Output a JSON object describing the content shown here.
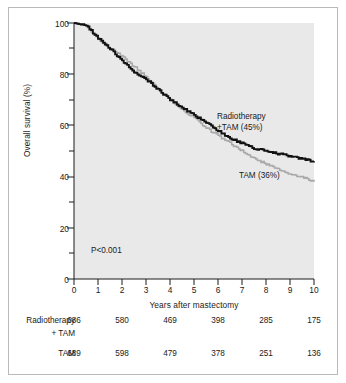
{
  "chart_data": {
    "type": "line",
    "title": "",
    "xlabel": "Years after mastectomy",
    "ylabel": "Overall survival (%)",
    "xlim": [
      0,
      10
    ],
    "ylim": [
      0,
      100
    ],
    "grid": false,
    "x_ticks": [
      "0",
      "1",
      "2",
      "3",
      "4",
      "5",
      "6",
      "7",
      "8",
      "9",
      "10"
    ],
    "y_ticks": [
      "0",
      "20",
      "40",
      "60",
      "80",
      "100"
    ],
    "y_minor_ticks": [
      10,
      30,
      50,
      70,
      90
    ],
    "annotation": "P<0.001",
    "legend_position": "inline-right",
    "series": [
      {
        "name": "Radiotherapy +TAM",
        "label": "Radiotherapy\n+TAM (45%)",
        "label_line1": "Radiotherapy",
        "label_line2": "+TAM (45%)",
        "color": "#111111",
        "final_value": 45,
        "x": [
          0,
          0.5,
          1,
          1.5,
          2,
          2.5,
          3,
          3.5,
          4,
          4.5,
          5,
          5.5,
          6,
          6.5,
          7,
          7.5,
          8,
          8.5,
          9,
          9.5,
          10
        ],
        "values": [
          100,
          99,
          94,
          90,
          85,
          81,
          78,
          74,
          70,
          67,
          64,
          61,
          58,
          55,
          53,
          51,
          50,
          49,
          48,
          47,
          46
        ]
      },
      {
        "name": "TAM",
        "label": "TAM (36%)",
        "label_line1": "TAM (36%)",
        "color": "#a8a8a8",
        "final_value": 36,
        "x": [
          0,
          0.5,
          1,
          1.5,
          2,
          2.5,
          3,
          3.5,
          4,
          4.5,
          5,
          5.5,
          6,
          6.5,
          7,
          7.5,
          8,
          8.5,
          9,
          9.5,
          10
        ],
        "values": [
          100,
          99,
          94,
          90,
          87,
          83,
          79,
          74,
          70,
          66,
          63,
          59,
          56,
          53,
          50,
          47,
          45,
          43,
          41,
          40,
          38
        ]
      }
    ]
  },
  "risk_table": {
    "columns": [
      "0",
      "2",
      "4",
      "6",
      "8",
      "10"
    ],
    "rows": [
      {
        "name": "Radiotherapy",
        "name_line2": "+ TAM",
        "values": [
          "686",
          "580",
          "469",
          "398",
          "285",
          "175"
        ]
      },
      {
        "name": "TAM",
        "name_line2": "",
        "values": [
          "689",
          "598",
          "479",
          "378",
          "251",
          "136"
        ]
      }
    ]
  }
}
